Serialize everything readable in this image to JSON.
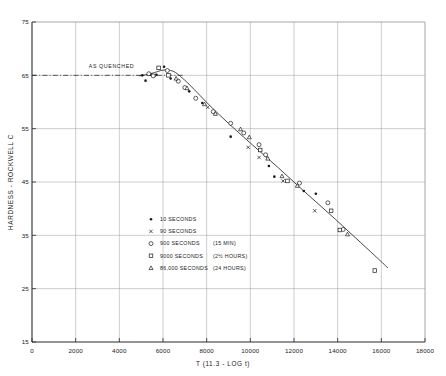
{
  "chart_data": {
    "type": "scatter",
    "title": "",
    "xlabel": "T (11.3 - LOG t)",
    "ylabel": "HARDNESS - ROCKWELL C",
    "xlim": [
      0,
      18000
    ],
    "ylim": [
      15,
      75
    ],
    "xticks": [
      0,
      2000,
      4000,
      6000,
      8000,
      10000,
      12000,
      14000,
      16000,
      18000
    ],
    "xtick_labels": [
      "0",
      "2000",
      "4000",
      "6000",
      "8000",
      "10000",
      "12000",
      "14000",
      "16000",
      "18000"
    ],
    "yticks": [
      15,
      25,
      35,
      45,
      55,
      65,
      75
    ],
    "ytick_labels": [
      "15",
      "25",
      "35",
      "45",
      "55",
      "65",
      "75"
    ],
    "grid": true,
    "legend_position": "center",
    "annotations": [
      {
        "name": "as-quenched-label",
        "text": "AS QUENCHED",
        "x": 2600,
        "y": 66.4
      },
      {
        "name": "as-quenched-line",
        "text": "",
        "x": 0,
        "y": 65.0
      }
    ],
    "as_quenched_hardness": 65.0,
    "series": [
      {
        "name": "10 SECONDS",
        "marker": "filled-circle",
        "points": [
          [
            5050,
            65.0
          ],
          [
            5200,
            64.0
          ],
          [
            5450,
            65.1
          ],
          [
            5700,
            65.1
          ],
          [
            6050,
            66.6
          ],
          [
            6350,
            64.4
          ],
          [
            7200,
            62.0
          ],
          [
            7800,
            59.8
          ],
          [
            9100,
            53.5
          ],
          [
            10850,
            48.0
          ],
          [
            12450,
            43.3
          ],
          [
            13000,
            42.8
          ],
          [
            11100,
            46.0
          ]
        ]
      },
      {
        "name": "90 SECONDS",
        "marker": "cross",
        "points": [
          [
            5600,
            65.0
          ],
          [
            8050,
            59.0
          ],
          [
            10400,
            49.6
          ],
          [
            12950,
            39.6
          ],
          [
            9900,
            51.5
          ],
          [
            11500,
            45.2
          ]
        ]
      },
      {
        "name": "900 SECONDS   (15 MIN)",
        "marker": "open-circle",
        "points": [
          [
            5350,
            65.3
          ],
          [
            5550,
            64.9
          ],
          [
            6200,
            65.9
          ],
          [
            6700,
            63.9
          ],
          [
            7000,
            62.7
          ],
          [
            7500,
            60.7
          ],
          [
            9100,
            56.0
          ],
          [
            9700,
            54.2
          ],
          [
            10400,
            52.0
          ],
          [
            10700,
            50.1
          ],
          [
            12250,
            44.8
          ],
          [
            13550,
            41.1
          ],
          [
            14250,
            36.1
          ],
          [
            8300,
            58.2
          ]
        ]
      },
      {
        "name": "9000 SECONDS   (2 1/2 HOURS)",
        "marker": "open-square",
        "points": [
          [
            5800,
            66.4
          ],
          [
            6250,
            65.0
          ],
          [
            11700,
            45.2
          ],
          [
            13700,
            39.6
          ],
          [
            14100,
            36.0
          ],
          [
            15700,
            28.4
          ],
          [
            10450,
            51.0
          ]
        ]
      },
      {
        "name": "86,000 SECONDS (24 HOURS)",
        "marker": "triangle",
        "points": [
          [
            6600,
            64.4
          ],
          [
            7100,
            62.6
          ],
          [
            7900,
            59.6
          ],
          [
            8400,
            57.8
          ],
          [
            9550,
            54.9
          ],
          [
            9950,
            53.4
          ],
          [
            11450,
            46.1
          ],
          [
            12150,
            44.3
          ],
          [
            14450,
            35.2
          ],
          [
            10800,
            49.4
          ]
        ]
      }
    ],
    "fit_curve": [
      [
        4900,
        64.9
      ],
      [
        5200,
        65.1
      ],
      [
        5600,
        65.5
      ],
      [
        5900,
        65.9
      ],
      [
        6200,
        66.0
      ],
      [
        6500,
        65.7
      ],
      [
        6800,
        64.8
      ],
      [
        7200,
        63.3
      ],
      [
        7700,
        61.2
      ],
      [
        8300,
        58.7
      ],
      [
        9000,
        56.0
      ],
      [
        9700,
        53.4
      ],
      [
        10500,
        50.5
      ],
      [
        11300,
        47.6
      ],
      [
        12100,
        44.6
      ],
      [
        13000,
        41.3
      ],
      [
        13900,
        38.0
      ],
      [
        14800,
        34.6
      ],
      [
        15700,
        31.2
      ],
      [
        16300,
        28.9
      ]
    ],
    "legend": [
      {
        "marker": "filled-circle",
        "label": "10  SECONDS",
        "suffix": ""
      },
      {
        "marker": "cross",
        "label": "90  SECONDS",
        "suffix": ""
      },
      {
        "marker": "open-circle",
        "label": "900 SECONDS",
        "suffix": "(15 MIN)"
      },
      {
        "marker": "open-square",
        "label": "9000 SECONDS",
        "suffix": "(2½ HOURS)"
      },
      {
        "marker": "triangle",
        "label": "86,000 SECONDS",
        "suffix": "(24 HOURS)"
      }
    ]
  },
  "colors": {
    "ink": "#1a1a1a",
    "grid": "#9a9a9a",
    "axis": "#2b2b2b",
    "background": "#ffffff"
  }
}
